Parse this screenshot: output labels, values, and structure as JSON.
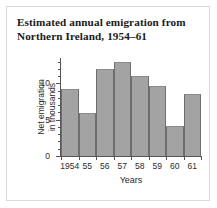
{
  "chart_data": {
    "type": "bar",
    "title": "Estimated annual emigration from Northern Ireland, 1954–61",
    "title_line1": "Estimated annual emigration from",
    "title_line2": "Northern Ireland, 1954–61",
    "categories": [
      "1954",
      "55",
      "56",
      "57",
      "58",
      "59",
      "60",
      "61"
    ],
    "values": [
      9.3,
      5.9,
      12.0,
      12.9,
      11.0,
      9.6,
      4.2,
      8.6
    ],
    "xlabel": "Years",
    "ylabel": "Net emigration in thousands",
    "ylabel_line1": "Net emigration",
    "ylabel_line2": "in thousands",
    "ylim": [
      0,
      13.5
    ],
    "ytick_labels": [
      "0",
      "5",
      "10"
    ],
    "ytick_values": [
      0,
      5,
      10
    ],
    "yminor_values": [
      1,
      2,
      3,
      4,
      6,
      7,
      8,
      9,
      11,
      12,
      13
    ],
    "grid": false,
    "legend": false,
    "bar_color": "#a3a3a3",
    "bar_edge_color": "#6e6e6e",
    "axis_color": "#555555",
    "background_color": "#ffffff",
    "frame_color": "#d8d8d8",
    "text_color": "#2b2b2b"
  }
}
